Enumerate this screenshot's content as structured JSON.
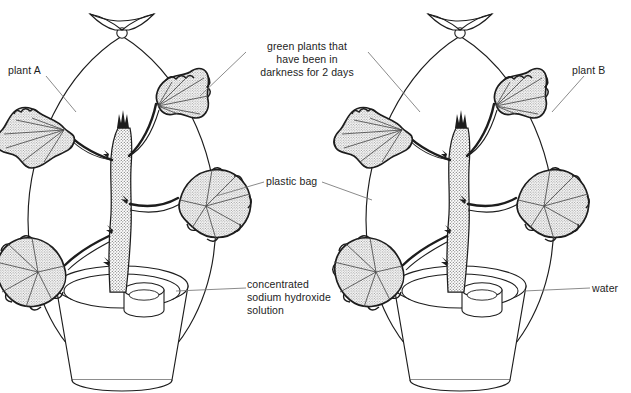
{
  "diagram": {
    "type": "biology-experiment-diagram",
    "colors": {
      "background": "#ffffff",
      "outline": "#1d1d1d",
      "leader_line": "#6b6b6b",
      "stipple_fill": "#d9d9d9",
      "text": "#1d1d1d"
    },
    "labels": {
      "plant_a": "plant A",
      "plant_b": "plant B",
      "darkness": "green plants that\nhave been in\ndarkness for 2 days",
      "plastic_bag": "plastic bag",
      "sodium_hydroxide": "concentrated\nsodium hydroxide\nsolution",
      "water": "water"
    },
    "setups": [
      {
        "id": "A",
        "name": "plant A",
        "dish_contents": "concentrated sodium hydroxide solution",
        "enclosure": "plastic bag",
        "pretreatment": "green plants that have been in darkness for 2 days"
      },
      {
        "id": "B",
        "name": "plant B",
        "dish_contents": "water",
        "enclosure": "plastic bag",
        "pretreatment": "green plants that have been in darkness for 2 days"
      }
    ],
    "icons": {
      "bag_tie": "bag-tie-bowtie-icon",
      "plant": "potted-plant-icon",
      "dish": "open-dish-icon"
    }
  }
}
